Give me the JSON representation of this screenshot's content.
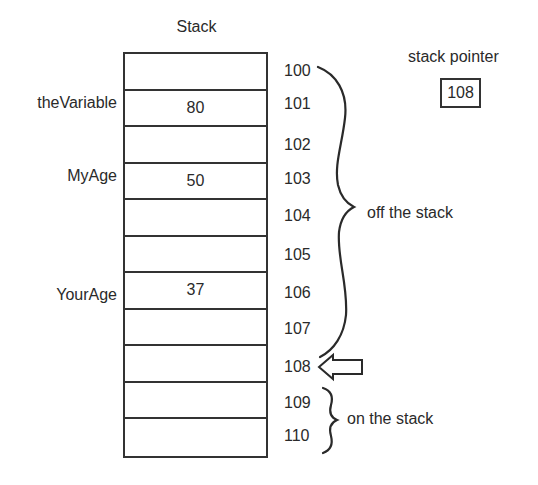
{
  "title": "Stack",
  "stack_pointer": {
    "label": "stack pointer",
    "value": "108"
  },
  "cells": [
    {
      "address": "100",
      "value": "",
      "label": ""
    },
    {
      "address": "101",
      "value": "80",
      "label": "theVariable"
    },
    {
      "address": "102",
      "value": "",
      "label": ""
    },
    {
      "address": "103",
      "value": "50",
      "label": "MyAge"
    },
    {
      "address": "104",
      "value": "",
      "label": ""
    },
    {
      "address": "105",
      "value": "",
      "label": ""
    },
    {
      "address": "106",
      "value": "37",
      "label": "YourAge"
    },
    {
      "address": "107",
      "value": "",
      "label": ""
    },
    {
      "address": "108",
      "value": "",
      "label": ""
    },
    {
      "address": "109",
      "value": "",
      "label": ""
    },
    {
      "address": "110",
      "value": "",
      "label": ""
    }
  ],
  "annotations": {
    "off_stack": "off the stack",
    "on_stack": "on the stack"
  },
  "colors": {
    "line": "#333333",
    "text": "#2a2a2a"
  }
}
